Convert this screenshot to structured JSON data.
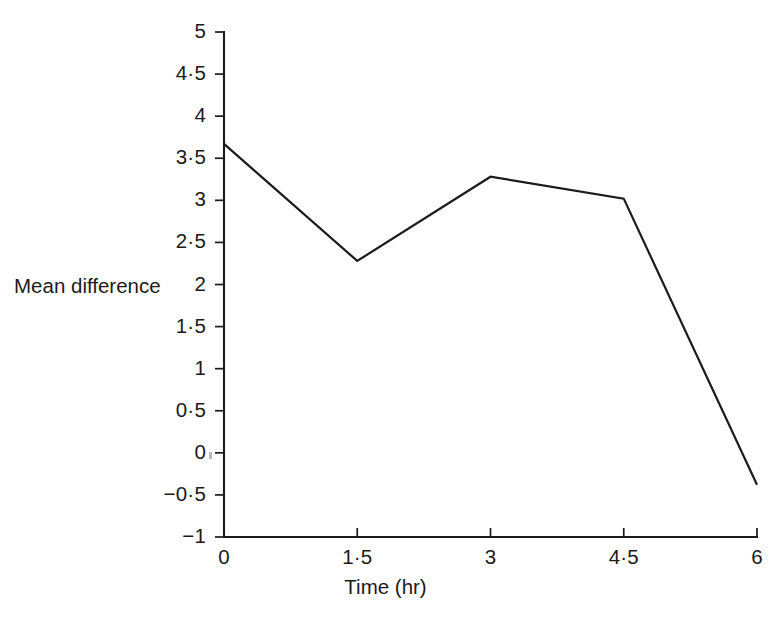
{
  "chart_data": {
    "type": "line",
    "title": "",
    "subtitle": "",
    "xlabel": "Time (hr)",
    "ylabel": "Mean difference",
    "x": [
      0,
      1.5,
      3,
      4.5,
      6
    ],
    "values": [
      3.67,
      2.28,
      3.28,
      3.02,
      -0.38
    ],
    "series": [
      {
        "name": "Mean difference",
        "values": [
          3.67,
          2.28,
          3.28,
          3.02,
          -0.38
        ]
      }
    ],
    "xlim": [
      0,
      6
    ],
    "ylim": [
      -1,
      5
    ],
    "grid": false,
    "legend": "none",
    "x_tick_values": [
      0,
      1.5,
      3,
      4.5,
      6
    ],
    "x_tick_labels": [
      "0",
      "1·5",
      "3",
      "4·5",
      "6"
    ],
    "y_tick_values": [
      5,
      4.5,
      4,
      3.5,
      3,
      2.5,
      2,
      1.5,
      1,
      0.5,
      0,
      -0.5,
      -1
    ],
    "y_tick_labels": [
      "5",
      "4·5",
      "4",
      "3·5",
      "3",
      "2·5",
      "2",
      "1·5",
      "1",
      "0·5",
      "0",
      "−0·5",
      "−1"
    ],
    "line_color": "#1b1b1b",
    "background_color": "#ffffff"
  },
  "axes": {
    "y_title": "Mean difference",
    "x_title": "Time (hr)"
  }
}
